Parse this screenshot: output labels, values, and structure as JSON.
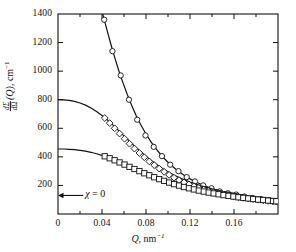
{
  "figure": {
    "background_color": "#ffffff",
    "line_color": "#111111",
    "axis_color": "#111111"
  },
  "chart_data": {
    "type": "line",
    "title": "",
    "subtitle": "",
    "xlabel": "Q, nm⁻¹",
    "ylabel": "dΣ/dΩ (Q), cm⁻¹",
    "xlim": [
      0,
      0.2
    ],
    "ylim": [
      0,
      1400
    ],
    "xticks": [
      0,
      0.04,
      0.08,
      0.12,
      0.16
    ],
    "xtick_labels": [
      "0",
      "0.04",
      "0.08",
      "0.12",
      "0.16"
    ],
    "xticks_minor": [
      0.02,
      0.06,
      0.1,
      0.14,
      0.18
    ],
    "yticks": [
      0,
      200,
      400,
      600,
      800,
      1000,
      1200,
      1400
    ],
    "ytick_labels": [
      "",
      "200",
      "400",
      "600",
      "800",
      "1000",
      "1200",
      "1400"
    ],
    "grid": false,
    "legend": null,
    "annotations": [
      {
        "name": "chi-zero",
        "text": "χ = 0",
        "x": 0.012,
        "y": 130,
        "arrow_to_x": 0.0,
        "arrow_to_y": 130
      }
    ],
    "series": [
      {
        "name": "upper-curve",
        "marker": "circle",
        "marker_size": 3.4,
        "line": "solid",
        "color": "#111111",
        "curve_x": [
          0.0335,
          0.036,
          0.039,
          0.042,
          0.045,
          0.048,
          0.051,
          0.055,
          0.059,
          0.063,
          0.067,
          0.071,
          0.075,
          0.08,
          0.085,
          0.09,
          0.095,
          0.1,
          0.105,
          0.11,
          0.115,
          0.12,
          0.125,
          0.13,
          0.135,
          0.14,
          0.145,
          0.15,
          0.155,
          0.16,
          0.165,
          0.17,
          0.175,
          0.18,
          0.185,
          0.19,
          0.195,
          0.2
        ],
        "curve_y": [
          1620,
          1540,
          1450,
          1360,
          1275,
          1190,
          1110,
          1010,
          920,
          836,
          760,
          690,
          628,
          560,
          500,
          448,
          402,
          362,
          327,
          296,
          270,
          246,
          226,
          208,
          192,
          178,
          166,
          155,
          145,
          136,
          128,
          121,
          114,
          108,
          103,
          98,
          93,
          89
        ],
        "points_x": [
          0.042,
          0.0495,
          0.057,
          0.0645,
          0.072,
          0.0795,
          0.087,
          0.0945,
          0.102,
          0.1095,
          0.117,
          0.1245,
          0.132,
          0.1395,
          0.147,
          0.1545,
          0.162,
          0.1695,
          0.177,
          0.1845,
          0.192,
          0.1985
        ],
        "points_y": [
          1360,
          1140,
          970,
          800,
          660,
          550,
          470,
          405,
          345,
          300,
          258,
          228,
          200,
          180,
          158,
          145,
          136,
          122,
          112,
          104,
          96,
          90
        ]
      },
      {
        "name": "middle-curve",
        "marker": "diamond",
        "marker_size": 3.4,
        "line": "solid",
        "color": "#111111",
        "y0": 800,
        "curve_x": [
          0.0,
          0.005,
          0.01,
          0.015,
          0.02,
          0.025,
          0.03,
          0.035,
          0.04,
          0.045,
          0.05,
          0.055,
          0.06,
          0.065,
          0.07,
          0.075,
          0.08,
          0.085,
          0.09,
          0.095,
          0.1,
          0.105,
          0.11,
          0.115,
          0.12,
          0.125,
          0.13,
          0.135,
          0.14,
          0.145,
          0.15,
          0.155,
          0.16,
          0.165,
          0.17,
          0.175,
          0.18,
          0.185,
          0.19,
          0.195,
          0.2
        ],
        "curve_y": [
          800,
          799,
          795,
          788,
          777,
          762,
          742,
          718,
          690,
          658,
          622,
          585,
          547,
          509,
          472,
          437,
          404,
          373,
          345,
          319,
          296,
          275,
          256,
          239,
          224,
          210,
          197,
          186,
          176,
          167,
          158,
          151,
          144,
          137,
          131,
          126,
          120,
          116,
          111,
          107,
          103
        ],
        "points_x": [
          0.0425,
          0.047,
          0.0515,
          0.056,
          0.0605,
          0.065,
          0.0695,
          0.074,
          0.0785,
          0.083,
          0.0875,
          0.092,
          0.0965,
          0.101,
          0.1055,
          0.11,
          0.1145,
          0.119,
          0.1235,
          0.128,
          0.1325,
          0.137,
          0.1415,
          0.146,
          0.1505,
          0.155,
          0.1595,
          0.164,
          0.1685,
          0.173,
          0.1775,
          0.182,
          0.1865,
          0.191,
          0.1955,
          0.1985
        ],
        "points_y": [
          672,
          636,
          600,
          563,
          527,
          492,
          458,
          427,
          397,
          368,
          342,
          318,
          295,
          274,
          254,
          237,
          221,
          207,
          194,
          182,
          171,
          161,
          152,
          144,
          137,
          130,
          124,
          118,
          113,
          108,
          104,
          100,
          96,
          92,
          89,
          87
        ]
      },
      {
        "name": "lower-curve",
        "marker": "square",
        "marker_size": 3.4,
        "line": "solid",
        "color": "#111111",
        "y0": 455,
        "curve_x": [
          0.0,
          0.005,
          0.01,
          0.015,
          0.02,
          0.025,
          0.03,
          0.035,
          0.04,
          0.045,
          0.05,
          0.055,
          0.06,
          0.065,
          0.07,
          0.075,
          0.08,
          0.085,
          0.09,
          0.095,
          0.1,
          0.105,
          0.11,
          0.115,
          0.12,
          0.125,
          0.13,
          0.135,
          0.14,
          0.145,
          0.15,
          0.155,
          0.16,
          0.165,
          0.17,
          0.175,
          0.18,
          0.185,
          0.19,
          0.195,
          0.2
        ],
        "curve_y": [
          455,
          455,
          453,
          450,
          446,
          440,
          432,
          422,
          410,
          397,
          383,
          367,
          351,
          335,
          318,
          302,
          286,
          271,
          256,
          242,
          229,
          217,
          205,
          195,
          185,
          176,
          167,
          159,
          152,
          145,
          139,
          133,
          128,
          123,
          118,
          114,
          110,
          106,
          103,
          99,
          96
        ],
        "points_x": [
          0.0425,
          0.047,
          0.0515,
          0.056,
          0.0605,
          0.065,
          0.0695,
          0.074,
          0.0785,
          0.083,
          0.0875,
          0.092,
          0.0965,
          0.101,
          0.1055,
          0.11,
          0.1145,
          0.119,
          0.1235,
          0.128,
          0.1325,
          0.137,
          0.1415,
          0.146,
          0.1505,
          0.155,
          0.1595,
          0.164,
          0.1685,
          0.173,
          0.1775,
          0.182,
          0.1865,
          0.191,
          0.1955,
          0.1985
        ],
        "points_y": [
          404,
          390,
          376,
          361,
          346,
          330,
          315,
          300,
          285,
          271,
          257,
          244,
          232,
          220,
          209,
          199,
          189,
          180,
          172,
          164,
          157,
          150,
          144,
          138,
          132,
          127,
          122,
          117,
          113,
          109,
          105,
          101,
          98,
          94,
          91,
          89
        ]
      }
    ]
  }
}
